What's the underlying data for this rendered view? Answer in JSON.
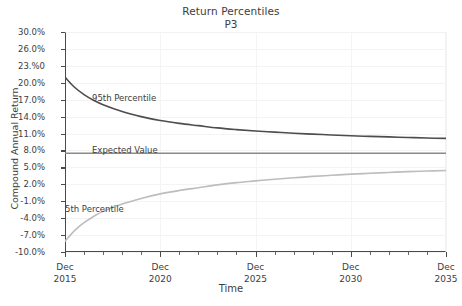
{
  "chart_data": {
    "type": "line",
    "title": "Return Percentiles",
    "subtitle": "P3",
    "xlabel": "Time",
    "ylabel": "Compound Annual Return",
    "grid": true,
    "legend_position": "inline-annotations",
    "x_tick_labels": [
      {
        "line1": "Dec",
        "line2": "2015"
      },
      {
        "line1": "Dec",
        "line2": "2020"
      },
      {
        "line1": "Dec",
        "line2": "2025"
      },
      {
        "line1": "Dec",
        "line2": "2030"
      },
      {
        "line1": "Dec",
        "line2": "2035"
      }
    ],
    "y_tick_labels": [
      "30.0%",
      "26.0%",
      "23.%0",
      "20.0%",
      "17.0%",
      "14.0%",
      "11.0%",
      "8.0%",
      "5.0%",
      "2.0%",
      "-1.0%",
      "-4.0%",
      "-7.0%",
      "-10.0%"
    ],
    "y_tick_values": [
      30.0,
      26.0,
      23.0,
      20.0,
      17.0,
      14.0,
      11.0,
      8.0,
      5.0,
      2.0,
      -1.0,
      -4.0,
      -7.0,
      -10.0
    ],
    "ylim": [
      -10.0,
      30.0
    ],
    "xlim": [
      2015,
      2035
    ],
    "x": [
      2015,
      2015.5,
      2016,
      2016.5,
      2017,
      2018,
      2019,
      2020,
      2021,
      2022,
      2023,
      2024,
      2025,
      2026,
      2027,
      2028,
      2029,
      2030,
      2031,
      2032,
      2033,
      2034,
      2035
    ],
    "series": [
      {
        "name": "95th Percentile",
        "color": "#4d4d4d",
        "values": [
          21.0,
          19.2,
          17.9,
          16.9,
          16.1,
          14.9,
          14.0,
          13.3,
          12.8,
          12.4,
          12.0,
          11.7,
          11.45,
          11.25,
          11.05,
          10.9,
          10.75,
          10.6,
          10.5,
          10.4,
          10.3,
          10.2,
          10.15
        ]
      },
      {
        "name": "Expected Value",
        "color": "#8a8a8a",
        "values": [
          7.5,
          7.5,
          7.5,
          7.5,
          7.5,
          7.5,
          7.5,
          7.5,
          7.5,
          7.5,
          7.5,
          7.5,
          7.5,
          7.5,
          7.5,
          7.5,
          7.5,
          7.5,
          7.5,
          7.5,
          7.5,
          7.5,
          7.5
        ]
      },
      {
        "name": "5th Percentile",
        "color": "#bdbdbd",
        "values": [
          -8.1,
          -6.2,
          -4.8,
          -3.7,
          -2.8,
          -1.5,
          -0.5,
          0.3,
          0.9,
          1.4,
          1.9,
          2.3,
          2.6,
          2.9,
          3.15,
          3.4,
          3.6,
          3.8,
          3.95,
          4.1,
          4.25,
          4.35,
          4.45
        ]
      }
    ]
  }
}
